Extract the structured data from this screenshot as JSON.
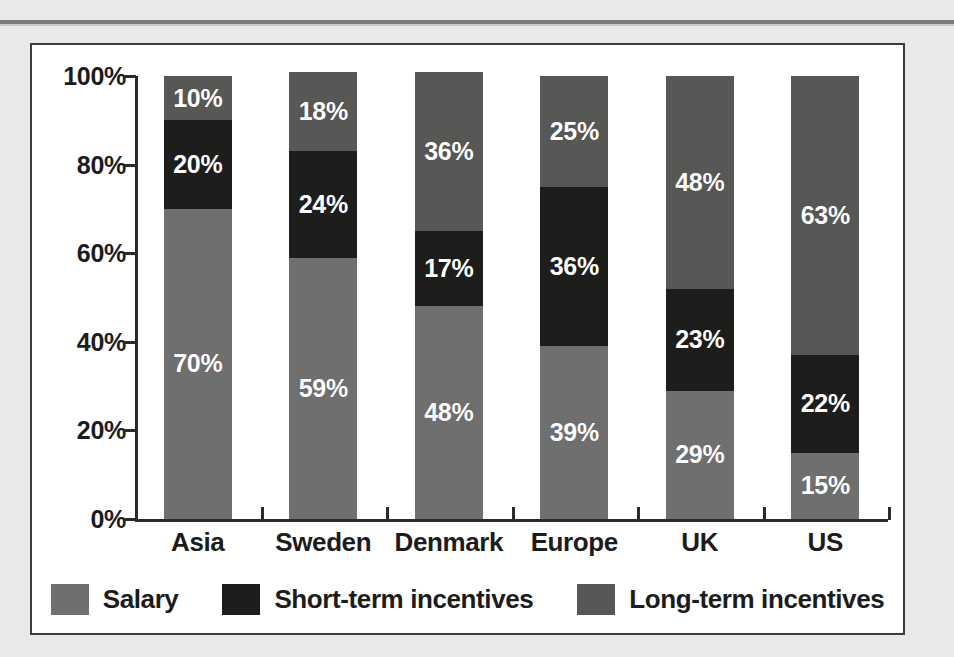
{
  "chart_data": {
    "type": "bar",
    "subtype": "stacked-100-percent",
    "title": "",
    "xlabel": "",
    "ylabel": "",
    "ylim": [
      0,
      100
    ],
    "ytick_labels": [
      "0%",
      "20%",
      "40%",
      "60%",
      "80%",
      "100%"
    ],
    "ytick_values": [
      0,
      20,
      40,
      60,
      80,
      100
    ],
    "grid": false,
    "legend_position": "bottom",
    "categories": [
      "Asia",
      "Sweden",
      "Denmark",
      "Europe",
      "UK",
      "US"
    ],
    "series": [
      {
        "name": "Salary",
        "color": "#706f6f",
        "values": [
          70,
          59,
          48,
          39,
          29,
          15
        ],
        "labels": [
          "70%",
          "59%",
          "48%",
          "39%",
          "29%",
          "15%"
        ]
      },
      {
        "name": "Short-term incentives",
        "color": "#1d1d1b",
        "values": [
          20,
          24,
          17,
          36,
          23,
          22
        ],
        "labels": [
          "20%",
          "24%",
          "17%",
          "36%",
          "23%",
          "22%"
        ]
      },
      {
        "name": "Long-term incentives",
        "color": "#575756",
        "values": [
          10,
          18,
          36,
          25,
          48,
          63
        ],
        "labels": [
          "10%",
          "18%",
          "36%",
          "25%",
          "48%",
          "63%"
        ]
      }
    ]
  },
  "colors": {
    "page_background": "#e9e9e7",
    "panel_background": "#ffffff",
    "panel_border": "#3c3c3c",
    "axis": "#2b2b2b",
    "text": "#1c1c1c",
    "label_text": "#ffffff",
    "salary": "#706f6f",
    "short_term": "#1d1d1b",
    "long_term": "#575756"
  }
}
